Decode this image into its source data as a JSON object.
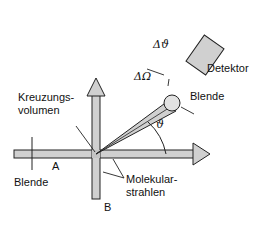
{
  "diagram": {
    "type": "crossed-molecular-beam-scattering",
    "labels": {
      "crossing_volume_line1": "Kreuzungs-",
      "crossing_volume_line2": "volumen",
      "detector": "Detektor",
      "aperture_detector": "Blende",
      "aperture_beam": "Blende",
      "beam_a": "A",
      "beam_b": "B",
      "molecular_beams_line1": "Molekular-",
      "molecular_beams_line2": "strahlen",
      "delta_theta": "Δϑ",
      "delta_omega": "ΔΩ",
      "theta": "ϑ"
    },
    "colors": {
      "fill_gray": "#d0d0d0",
      "stroke": "#222222",
      "background": "#ffffff"
    }
  }
}
